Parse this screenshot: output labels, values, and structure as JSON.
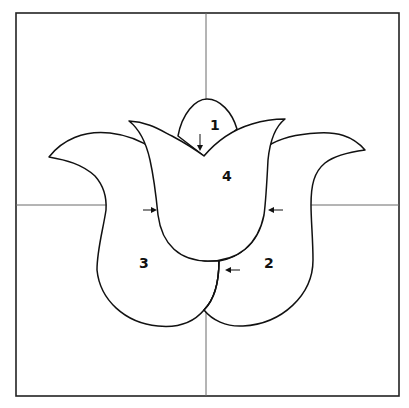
{
  "figure": {
    "colors": {
      "background": "#ffffff",
      "outline": "#111111",
      "frame": "#222222",
      "axis": "#6b6b6b"
    }
  },
  "labels": {
    "petal_1": "1",
    "petal_2": "2",
    "petal_3": "3",
    "petal_4": "4"
  },
  "arrows": [
    {
      "id": "top-v-arrow",
      "direction": "down"
    },
    {
      "id": "left-bowl-arrow",
      "direction": "right"
    },
    {
      "id": "right-bowl-arrow",
      "direction": "left"
    },
    {
      "id": "seam-arrow",
      "direction": "left"
    }
  ]
}
